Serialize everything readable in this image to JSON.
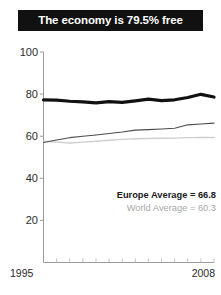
{
  "title": {
    "text": "The economy is 79.5% free",
    "background": "#111111",
    "color": "#ffffff"
  },
  "axes": {
    "y_ticks": [
      "100",
      "80",
      "60",
      "40",
      "20"
    ],
    "x_start_label": "1995",
    "x_end_label": "2008"
  },
  "legend": {
    "europe": "Europe Average = 66.8",
    "world": "World Average = 60.3"
  },
  "chart_data": {
    "type": "line",
    "title": "The economy is 79.5% free",
    "xlabel": "",
    "ylabel": "",
    "xlim": [
      1995,
      2008
    ],
    "ylim": [
      0,
      100
    ],
    "grid": false,
    "legend_position": "inside-lower-right",
    "x": [
      1995,
      1996,
      1997,
      1998,
      1999,
      2000,
      2001,
      2002,
      2003,
      2004,
      2005,
      2006,
      2007,
      2008
    ],
    "y_ticks": [
      20,
      40,
      60,
      80,
      100
    ],
    "series": [
      {
        "name": "Country",
        "color": "#111111",
        "width": 3.2,
        "values": [
          77.3,
          77.1,
          76.6,
          76.3,
          75.8,
          76.4,
          76.1,
          76.8,
          77.6,
          76.9,
          77.3,
          78.4,
          79.9,
          78.6
        ]
      },
      {
        "name": "Europe Average",
        "color": "#4d4d4d",
        "width": 1.1,
        "annotation": "Europe Average = 66.8",
        "values": [
          57.0,
          58.2,
          59.3,
          60.0,
          60.6,
          61.3,
          62.0,
          62.9,
          63.1,
          63.4,
          63.8,
          65.4,
          65.8,
          66.2
        ]
      },
      {
        "name": "World Average",
        "color": "#cfcfcf",
        "width": 1.4,
        "annotation": "World Average = 60.3",
        "values": [
          57.6,
          57.2,
          56.8,
          57.2,
          57.6,
          58.1,
          58.5,
          58.8,
          58.9,
          59.0,
          59.1,
          59.3,
          59.4,
          59.4
        ]
      }
    ]
  }
}
